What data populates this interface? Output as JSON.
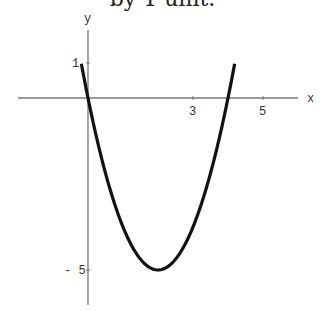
{
  "caption_fragment": "by 1 unit.",
  "chart_data": {
    "type": "line",
    "title": "",
    "xlabel": "x",
    "ylabel": "y",
    "xticks": [
      3,
      5
    ],
    "yticks": [
      1,
      -5
    ],
    "xlim": [
      -2,
      6
    ],
    "ylim": [
      -5.8,
      1.9
    ],
    "grid": false,
    "series": [
      {
        "name": "parabola",
        "function": "y = 1.25x^2 - 5x",
        "x": [
          -0.19,
          0,
          0.5,
          1,
          1.5,
          2,
          2.5,
          3,
          3.5,
          4,
          4.19
        ],
        "y": [
          1,
          0,
          -2.19,
          -3.75,
          -4.69,
          -5,
          -4.69,
          -3.75,
          -2.19,
          0,
          1
        ]
      }
    ],
    "color": "#111111"
  }
}
